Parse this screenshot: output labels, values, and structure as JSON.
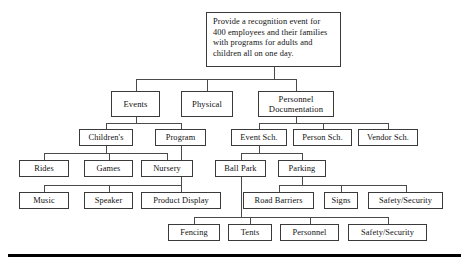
{
  "diagram": {
    "type": "tree",
    "canvas": {
      "width": 469,
      "height": 267
    },
    "style": {
      "box_border_color": "#3a3a3a",
      "box_fill_color": "#ffffff",
      "connector_color": "#4a4a4a",
      "text_color": "#111111",
      "rule_color": "#000000"
    },
    "nodes": [
      {
        "id": "root",
        "label": "Provide a recognition event for\n400 employees and their families\nwith programs for adults and\nchildren all on one day.",
        "x": 206,
        "y": 12,
        "w": 135,
        "h": 55,
        "font_size": 8.4,
        "root": true
      },
      {
        "id": "events",
        "label": "Events",
        "x": 111,
        "y": 91,
        "w": 49,
        "h": 26,
        "font_size": 8.6
      },
      {
        "id": "physical",
        "label": "Physical",
        "x": 181,
        "y": 91,
        "w": 52,
        "h": 26,
        "font_size": 8.6
      },
      {
        "id": "personnel-doc",
        "label": "Personnel\nDocumentation",
        "x": 258,
        "y": 91,
        "w": 76,
        "h": 26,
        "font_size": 8.6
      },
      {
        "id": "childrens",
        "label": "Children's",
        "x": 79,
        "y": 129,
        "w": 54,
        "h": 17,
        "font_size": 8.4
      },
      {
        "id": "program",
        "label": "Program",
        "x": 155,
        "y": 129,
        "w": 51,
        "h": 17,
        "font_size": 8.4
      },
      {
        "id": "event-sch",
        "label": "Event Sch.",
        "x": 231,
        "y": 129,
        "w": 56,
        "h": 17,
        "font_size": 8.4
      },
      {
        "id": "person-sch",
        "label": "Person Sch.",
        "x": 293,
        "y": 129,
        "w": 59,
        "h": 17,
        "font_size": 8.4
      },
      {
        "id": "vendor-sch",
        "label": "Vendor Sch.",
        "x": 358,
        "y": 129,
        "w": 60,
        "h": 17,
        "font_size": 8.4
      },
      {
        "id": "rides",
        "label": "Rides",
        "x": 19,
        "y": 160,
        "w": 50,
        "h": 17,
        "font_size": 8.4
      },
      {
        "id": "games",
        "label": "Games",
        "x": 84,
        "y": 160,
        "w": 49,
        "h": 17,
        "font_size": 8.4
      },
      {
        "id": "nursery",
        "label": "Nursery",
        "x": 141,
        "y": 160,
        "w": 52,
        "h": 17,
        "font_size": 8.4
      },
      {
        "id": "ball-park",
        "label": "Ball Park",
        "x": 215,
        "y": 160,
        "w": 51,
        "h": 17,
        "font_size": 8.4
      },
      {
        "id": "parking",
        "label": "Parking",
        "x": 278,
        "y": 160,
        "w": 48,
        "h": 17,
        "font_size": 8.4
      },
      {
        "id": "music",
        "label": "Music",
        "x": 19,
        "y": 192,
        "w": 50,
        "h": 17,
        "font_size": 8.4
      },
      {
        "id": "speaker",
        "label": "Speaker",
        "x": 84,
        "y": 192,
        "w": 49,
        "h": 17,
        "font_size": 8.4
      },
      {
        "id": "product-display",
        "label": "Product Display",
        "x": 141,
        "y": 192,
        "w": 80,
        "h": 17,
        "font_size": 8.4
      },
      {
        "id": "road-barriers",
        "label": "Road Barriers",
        "x": 243,
        "y": 192,
        "w": 71,
        "h": 17,
        "font_size": 8.4
      },
      {
        "id": "signs",
        "label": "Signs",
        "x": 324,
        "y": 192,
        "w": 34,
        "h": 17,
        "font_size": 8.4
      },
      {
        "id": "safety-security-parking",
        "label": "Safety/Security",
        "x": 368,
        "y": 192,
        "w": 75,
        "h": 17,
        "font_size": 8.4
      },
      {
        "id": "fencing",
        "label": "Fencing",
        "x": 168,
        "y": 224,
        "w": 52,
        "h": 17,
        "font_size": 8.4
      },
      {
        "id": "tents",
        "label": "Tents",
        "x": 228,
        "y": 224,
        "w": 44,
        "h": 17,
        "font_size": 8.4
      },
      {
        "id": "personnel",
        "label": "Personnel",
        "x": 280,
        "y": 224,
        "w": 59,
        "h": 17,
        "font_size": 8.4
      },
      {
        "id": "safety-security-ballpark",
        "label": "Safety/Security",
        "x": 348,
        "y": 224,
        "w": 79,
        "h": 17,
        "font_size": 8.4
      }
    ],
    "connectors": [
      {
        "from": "root",
        "to": [
          "events",
          "physical",
          "personnel-doc"
        ],
        "bus_y": 79
      },
      {
        "from": "events",
        "to": [
          "childrens",
          "program"
        ],
        "bus_y": 123
      },
      {
        "from": "personnel-doc",
        "to": [
          "event-sch",
          "person-sch",
          "vendor-sch"
        ],
        "bus_y": 123
      },
      {
        "from": "childrens",
        "to": [
          "rides",
          "games",
          "nursery"
        ],
        "bus_y": 153
      },
      {
        "from": "program",
        "to": [
          "music",
          "speaker",
          "product-display"
        ],
        "bus_y": 185
      },
      {
        "from": "event-sch",
        "to": [
          "ball-park",
          "parking"
        ],
        "bus_y": 153
      },
      {
        "from": "parking",
        "to": [
          "road-barriers",
          "signs",
          "safety-security-parking"
        ],
        "bus_y": 185
      },
      {
        "from": "ball-park",
        "to": [
          "fencing",
          "tents",
          "personnel",
          "safety-security-ballpark"
        ],
        "bus_y": 217
      }
    ],
    "bottom_rule": {
      "x": 8,
      "y": 254,
      "w": 453,
      "h": 3
    }
  }
}
